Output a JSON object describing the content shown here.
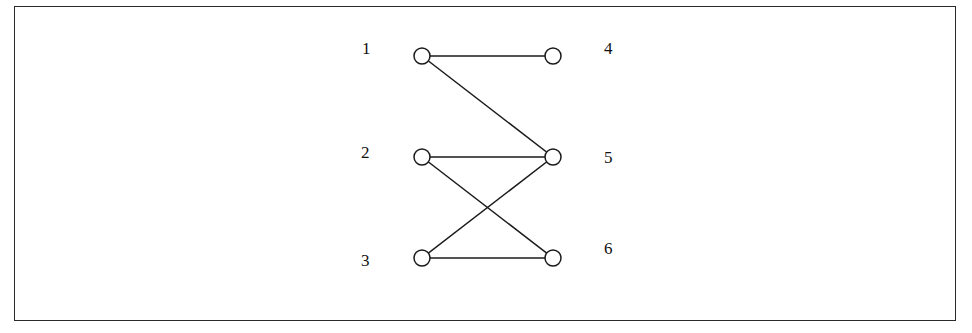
{
  "diagram": {
    "type": "bipartite-graph",
    "left_nodes": [
      "1",
      "2",
      "3"
    ],
    "right_nodes": [
      "4",
      "5",
      "6"
    ],
    "nodes": [
      {
        "id": "1",
        "label": "1",
        "cx": 422,
        "cy": 56,
        "lx": 362,
        "ly": 54
      },
      {
        "id": "2",
        "label": "2",
        "cx": 422,
        "cy": 157,
        "lx": 361,
        "ly": 158
      },
      {
        "id": "3",
        "label": "3",
        "cx": 422,
        "cy": 258,
        "lx": 361,
        "ly": 266
      },
      {
        "id": "4",
        "label": "4",
        "cx": 553,
        "cy": 56,
        "lx": 604,
        "ly": 54
      },
      {
        "id": "5",
        "label": "5",
        "cx": 553,
        "cy": 157,
        "lx": 604,
        "ly": 163
      },
      {
        "id": "6",
        "label": "6",
        "cx": 553,
        "cy": 258,
        "lx": 604,
        "ly": 254
      }
    ],
    "edges": [
      {
        "from": "1",
        "to": "4"
      },
      {
        "from": "1",
        "to": "5"
      },
      {
        "from": "2",
        "to": "5"
      },
      {
        "from": "2",
        "to": "6"
      },
      {
        "from": "3",
        "to": "5"
      },
      {
        "from": "3",
        "to": "6"
      }
    ],
    "node_radius": 8,
    "colors": {
      "stroke": "#1a1a1a",
      "node_fill": "#ffffff",
      "background": "#ffffff"
    }
  }
}
